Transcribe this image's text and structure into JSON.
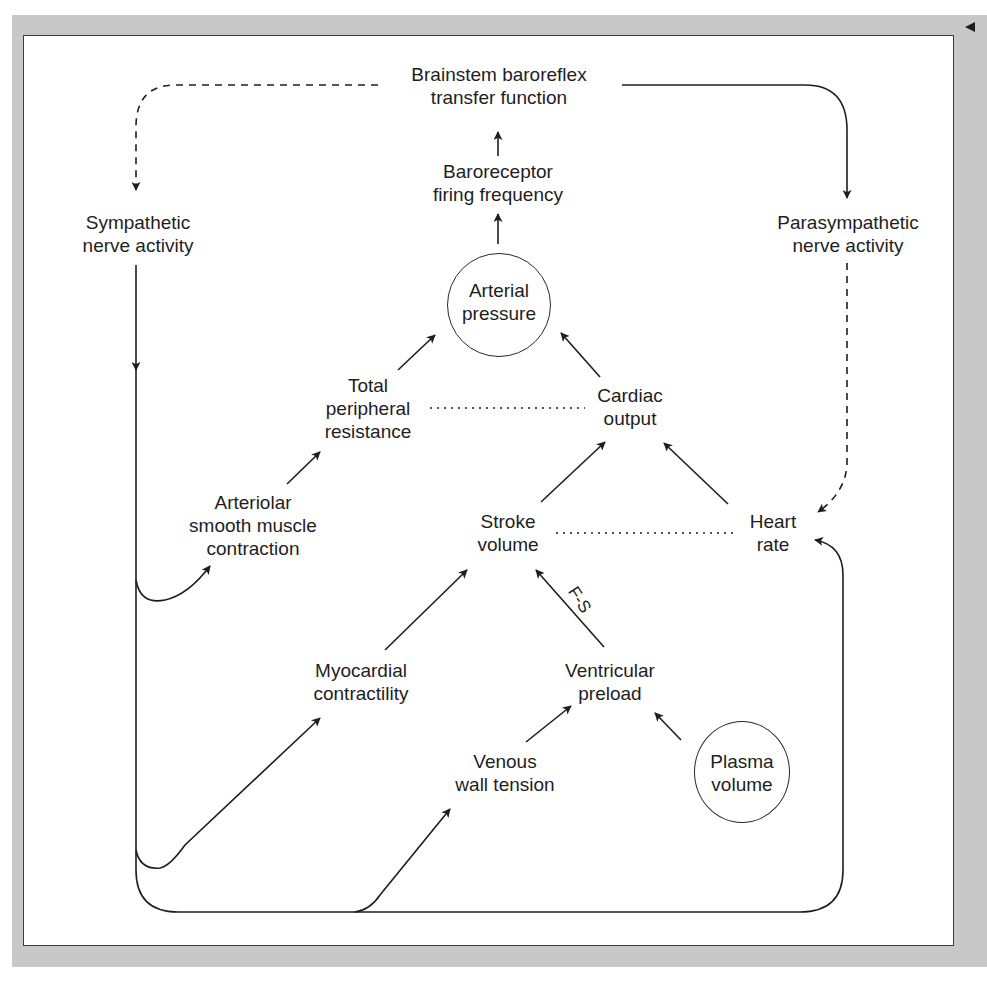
{
  "diagram": {
    "type": "baroreflex feedback flow diagram",
    "colors": {
      "line": "#1e1e1e",
      "frame": "#c8c8c8",
      "panel": "#ffffff"
    },
    "nodes": {
      "brainstem": {
        "line1": "Brainstem baroreflex",
        "line2": "transfer function"
      },
      "baroreceptor": {
        "line1": "Baroreceptor",
        "line2": "firing frequency"
      },
      "sympathetic": {
        "line1": "Sympathetic",
        "line2": "nerve activity"
      },
      "parasympathetic": {
        "line1": "Parasympathetic",
        "line2": "nerve activity"
      },
      "arterial_pressure": {
        "line1": "Arterial",
        "line2": "pressure"
      },
      "tpr": {
        "line1": "Total",
        "line2": "peripheral",
        "line3": "resistance"
      },
      "cardiac_output": {
        "line1": "Cardiac",
        "line2": "output"
      },
      "arteriolar": {
        "line1": "Arteriolar",
        "line2": "smooth muscle",
        "line3": "contraction"
      },
      "stroke_volume": {
        "line1": "Stroke",
        "line2": "volume"
      },
      "heart_rate": {
        "line1": "Heart",
        "line2": "rate"
      },
      "myocardial": {
        "line1": "Myocardial",
        "line2": "contractility"
      },
      "preload": {
        "line1": "Ventricular",
        "line2": "preload"
      },
      "venous": {
        "line1": "Venous",
        "line2": "wall tension"
      },
      "plasma": {
        "line1": "Plasma",
        "line2": "volume"
      }
    },
    "edge_labels": {
      "frank_starling": "F-S"
    },
    "edges": [
      {
        "from": "Baroreceptor firing frequency",
        "to": "Brainstem baroreflex transfer function",
        "style": "solid"
      },
      {
        "from": "Arterial pressure",
        "to": "Baroreceptor firing frequency",
        "style": "solid"
      },
      {
        "from": "Brainstem baroreflex transfer function",
        "to": "Sympathetic nerve activity",
        "style": "dashed"
      },
      {
        "from": "Brainstem baroreflex transfer function",
        "to": "Parasympathetic nerve activity",
        "style": "solid"
      },
      {
        "from": "Parasympathetic nerve activity",
        "to": "Heart rate",
        "style": "dashed"
      },
      {
        "from": "Total peripheral resistance",
        "to": "Arterial pressure",
        "style": "solid"
      },
      {
        "from": "Cardiac output",
        "to": "Arterial pressure",
        "style": "solid"
      },
      {
        "from": "Total peripheral resistance",
        "to": "Cardiac output",
        "style": "dotted"
      },
      {
        "from": "Arteriolar smooth muscle contraction",
        "to": "Total peripheral resistance",
        "style": "solid"
      },
      {
        "from": "Stroke volume",
        "to": "Cardiac output",
        "style": "solid"
      },
      {
        "from": "Heart rate",
        "to": "Cardiac output",
        "style": "solid"
      },
      {
        "from": "Stroke volume",
        "to": "Heart rate",
        "style": "dotted"
      },
      {
        "from": "Myocardial contractility",
        "to": "Stroke volume",
        "style": "solid"
      },
      {
        "from": "Ventricular preload",
        "to": "Stroke volume",
        "style": "solid",
        "label": "F-S"
      },
      {
        "from": "Venous wall tension",
        "to": "Ventricular preload",
        "style": "solid"
      },
      {
        "from": "Plasma volume",
        "to": "Ventricular preload",
        "style": "solid"
      },
      {
        "from": "Sympathetic nerve activity",
        "to": "Arteriolar smooth muscle contraction",
        "style": "solid"
      },
      {
        "from": "Sympathetic nerve activity",
        "to": "Myocardial contractility",
        "style": "solid"
      },
      {
        "from": "Sympathetic nerve activity",
        "to": "Venous wall tension",
        "style": "solid"
      },
      {
        "from": "Sympathetic nerve activity",
        "to": "Heart rate",
        "style": "solid"
      }
    ]
  }
}
